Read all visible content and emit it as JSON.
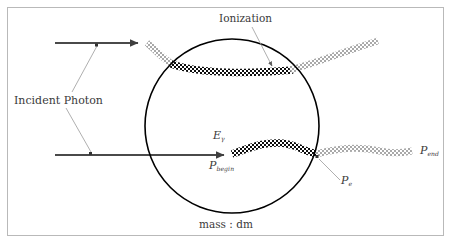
{
  "figure": {
    "width": 453,
    "height": 246,
    "background": "#ffffff",
    "frame_color": "#b9b9b9",
    "title": "",
    "type": "physics-schematic-diagram"
  },
  "colors": {
    "photon_arrow": "#4a4a4a",
    "photon_wave_outside": "#a8a8a8",
    "photon_wave_ionizing": "#111111",
    "circle_stroke": "#000000",
    "leader_line": "#9a9a9a",
    "text": "#3a3a3a"
  },
  "labels": {
    "ionization": "Ionization",
    "incident_photon": "Incident Photon",
    "photon_energy": "E",
    "photon_energy_sub": "γ",
    "momentum_begin": "P",
    "momentum_begin_sub": "begin",
    "momentum_electron": "P",
    "momentum_electron_sub": "e",
    "momentum_end": "P",
    "momentum_end_sub": "end",
    "mass_element": "mass : dm"
  },
  "geometry": {
    "circle": {
      "cx": 232,
      "cy": 126,
      "r": 87
    },
    "upper_photon": {
      "arrow_start_x": 55,
      "arrow_start_y": 43,
      "arrow_end_x": 143,
      "arrow_end_y": 43,
      "wave_label": "upper-photon-track"
    },
    "lower_photon": {
      "arrow_start_x": 55,
      "arrow_start_y": 155,
      "arrow_end_x": 228,
      "arrow_end_y": 155,
      "wave_label": "lower-photon-track"
    }
  },
  "annotations": [
    {
      "name": "ionization-pointer",
      "from": [
        252,
        27
      ],
      "to": [
        272,
        68
      ]
    },
    {
      "name": "incident-photon-pointer-upper",
      "from": [
        70,
        92
      ],
      "to": [
        98,
        46
      ]
    },
    {
      "name": "incident-photon-pointer-lower",
      "from": [
        66,
        108
      ],
      "to": [
        92,
        153
      ]
    },
    {
      "name": "pe-pointer",
      "from": [
        340,
        180
      ],
      "to": [
        317,
        158
      ]
    }
  ]
}
